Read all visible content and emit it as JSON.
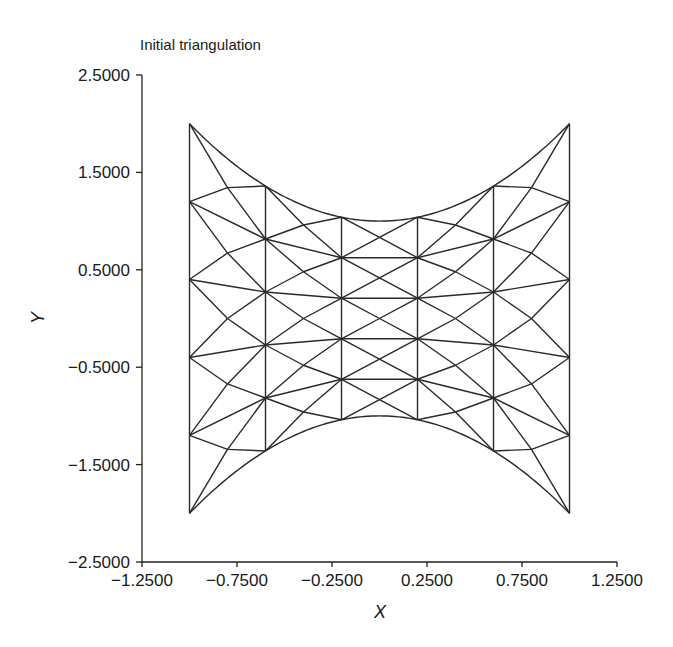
{
  "chart_data": {
    "type": "mesh",
    "title": "Initial triangulation",
    "xlabel": "X",
    "ylabel": "Y",
    "xlim": [
      -1.25,
      1.25
    ],
    "ylim": [
      -2.5,
      2.5
    ],
    "grid": false,
    "x_ticks": [
      -1.25,
      -0.75,
      -0.25,
      0.25,
      0.75,
      1.25
    ],
    "x_tick_labels": [
      "−1.2500",
      "−0.7500",
      "−0.2500",
      "0.2500",
      "0.7500",
      "1.2500"
    ],
    "y_ticks": [
      2.5,
      1.5,
      0.5,
      -0.5,
      -1.5,
      -2.5
    ],
    "y_tick_labels": [
      "2.5000",
      "1.5000",
      "0.5000",
      "−0.5000",
      "−1.5000",
      "−2.5000"
    ],
    "mesh": {
      "description": "Structured quad grid, each quad split into 4 triangles through its centroid; domain bounded by x=-1, x=1 and y=±(1+x^2)",
      "x_nodes": [
        -1.0,
        -0.6,
        -0.2,
        0.2,
        0.6,
        1.0
      ],
      "row_fractions": [
        1.0,
        0.6,
        0.2,
        -0.2,
        -0.6,
        -1.0
      ],
      "boundary_top": "y = 1 + x^2",
      "boundary_bottom": "y = -(1 + x^2)"
    }
  }
}
